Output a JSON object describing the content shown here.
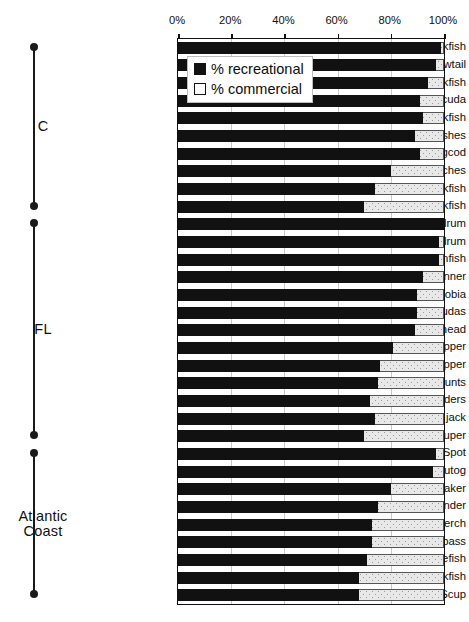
{
  "chart_data": {
    "type": "bar",
    "orientation": "horizontal",
    "stacked": true,
    "stacked_total": 100,
    "title": "",
    "xlabel": "",
    "ylabel": "",
    "xlim": [
      0,
      100
    ],
    "grid": true,
    "legend_position": "top-left-inside",
    "xticks": [
      "0%",
      "20%",
      "40%",
      "60%",
      "80%",
      "100%"
    ],
    "xtick_values": [
      0,
      20,
      40,
      60,
      80,
      100
    ],
    "legend": [
      {
        "label": "% recreational",
        "marker": "filled-square",
        "color": "#111111"
      },
      {
        "label": "% commercial",
        "marker": "open-square",
        "color": "#e8e8e8"
      }
    ],
    "series": [
      {
        "name": "% recreational",
        "values": [
          99,
          97,
          94,
          91,
          92,
          89,
          91,
          80,
          74,
          70,
          100,
          98,
          98,
          92,
          90,
          90,
          89,
          81,
          76,
          75,
          72,
          74,
          70,
          97,
          96,
          80,
          75,
          73,
          73,
          71,
          68,
          68
        ]
      },
      {
        "name": "% commercial",
        "values": [
          1,
          3,
          6,
          9,
          8,
          11,
          9,
          20,
          26,
          30,
          0,
          2,
          2,
          8,
          10,
          10,
          11,
          19,
          24,
          25,
          28,
          26,
          30,
          3,
          4,
          20,
          25,
          27,
          27,
          29,
          32,
          32
        ]
      }
    ],
    "categories": [
      "Olive rockfish",
      "Yellowtail",
      "Blue rockfish",
      "Pacific barracuda",
      "Greenspotted rockfish",
      "Scorpionfishes",
      "Lingcod",
      "Surfperches",
      "Copper rockfish",
      "Gopher rockfish",
      "Red drum",
      "Black drum",
      "Pinfish",
      "Blue runner",
      "Cobia",
      "Barracudas",
      "Sheepshead",
      "Gray snapper",
      "Red snapper",
      "Grunts",
      "Flounders",
      "Crevalle jack",
      "Gag grouper",
      "Spot",
      "Tautog",
      "Croaker",
      "Summer flounder",
      "White perch",
      "Black sea bass",
      "Bluefish",
      "Weakfish",
      "Scup"
    ],
    "groups": [
      {
        "label": "C",
        "start_index": 0,
        "end_index": 9
      },
      {
        "label": "FL",
        "start_index": 10,
        "end_index": 22
      },
      {
        "label": "Atlantic\nCoast",
        "start_index": 23,
        "end_index": 31
      }
    ]
  }
}
